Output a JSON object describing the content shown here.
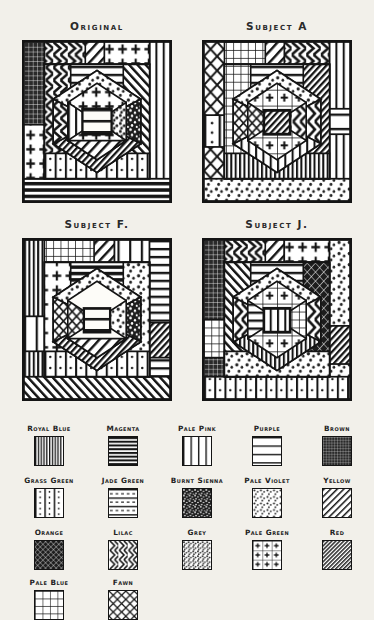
{
  "plate": {
    "title": "Quilt Block Pattern Reproductions",
    "background_color": "#f2f0ea",
    "ink_color": "#141414"
  },
  "panels": [
    {
      "id": "original",
      "title": "Original",
      "x": 22,
      "y": 40
    },
    {
      "id": "subject-a",
      "title": "Subject A",
      "x": 202,
      "y": 40
    },
    {
      "id": "subject-f",
      "title": "Subject F.",
      "x": 22,
      "y": 238
    },
    {
      "id": "subject-j",
      "title": "Subject J.",
      "x": 202,
      "y": 238
    }
  ],
  "legend": {
    "columns": 5,
    "rows": [
      [
        {
          "label": "Royal Blue",
          "pattern": "vertical-lines-dense"
        },
        {
          "label": "Magenta",
          "pattern": "horizontal-lines-heavy"
        },
        {
          "label": "Pale Pink",
          "pattern": "vertical-lines-wide"
        },
        {
          "label": "Purple",
          "pattern": "horizontal-lines-wide"
        },
        {
          "label": "Brown",
          "pattern": "fine-grid-dark"
        }
      ],
      [
        {
          "label": "Grass Green",
          "pattern": "vertical-bands-dotted"
        },
        {
          "label": "Jade Green",
          "pattern": "horizontal-bands-dashed"
        },
        {
          "label": "Burnt Sienna",
          "pattern": "dense-speckle-dark"
        },
        {
          "label": "Pale Violet",
          "pattern": "sparse-speckle"
        },
        {
          "label": "Yellow",
          "pattern": "diagonal-hatch"
        }
      ],
      [
        {
          "label": "Orange",
          "pattern": "cross-hatch-dark"
        },
        {
          "label": "Lilac",
          "pattern": "wavy-zigzag"
        },
        {
          "label": "Grey",
          "pattern": "stipple"
        },
        {
          "label": "Pale Green",
          "pattern": "plus-grid"
        },
        {
          "label": "Red",
          "pattern": "diagonal-hatch-dense"
        }
      ],
      [
        {
          "label": "Pale Blue",
          "pattern": "open-grid"
        },
        {
          "label": "Fawn",
          "pattern": "lattice-x"
        }
      ]
    ]
  }
}
